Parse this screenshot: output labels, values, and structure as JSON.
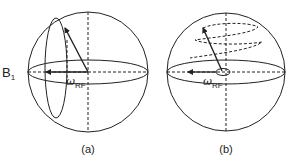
{
  "figure": {
    "panels": [
      {
        "id": "a",
        "caption": "(a)",
        "field_label": "B",
        "field_subscript": "1",
        "omega_symbol": "ω",
        "omega_subscript": "RF"
      },
      {
        "id": "b",
        "caption": "(b)",
        "omega_symbol": "ω",
        "omega_subscript": "RF"
      }
    ],
    "colors": {
      "stroke": "#222222",
      "background": "#ffffff"
    }
  }
}
